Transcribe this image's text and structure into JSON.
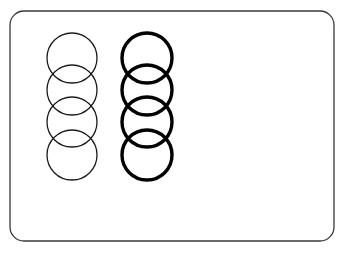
{
  "figure": {
    "canvas": {
      "width": 348,
      "height": 257,
      "background": "#ffffff"
    },
    "frame": {
      "label": "rounded-rectangle-card",
      "x": 10,
      "y": 11,
      "width": 324,
      "height": 230,
      "corner_radius": 14,
      "stroke_color": "#3a3a3a",
      "stroke_width": 1.3,
      "fill_color": "#ffffff"
    },
    "groups": [
      {
        "id": "left-column",
        "label": "Thin circles column",
        "weight": "thin",
        "stroke_color": "#1a1a1a",
        "stroke_width": 1.3,
        "center_x": 72,
        "radius": 25,
        "circle_count": 4,
        "center_ys": [
          58,
          90,
          122,
          155
        ]
      },
      {
        "id": "right-column",
        "label": "Thick circles column",
        "weight": "thick",
        "stroke_color": "#000000",
        "stroke_width": 3.4,
        "center_x": 147,
        "radius": 25,
        "circle_count": 4,
        "center_ys": [
          58,
          90,
          122,
          155
        ]
      }
    ]
  }
}
